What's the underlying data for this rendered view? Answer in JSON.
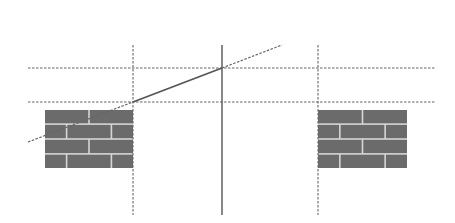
{
  "diagram": {
    "width": 455,
    "height": 223,
    "colors": {
      "background": "#ffffff",
      "brick": "#6b6b6b",
      "mortar": "#d6d6d6",
      "line": "#555555",
      "dashed": "#666666"
    },
    "guides": {
      "horizontal": [
        {
          "name": "upper-horizontal-guide",
          "y": 68,
          "x1": 28,
          "x2": 435
        },
        {
          "name": "lower-horizontal-guide",
          "y": 102,
          "x1": 28,
          "x2": 435
        }
      ],
      "vertical_dashed": [
        {
          "name": "left-vertical-guide",
          "x": 133,
          "y1": 45,
          "y2": 215
        },
        {
          "name": "right-vertical-guide",
          "x": 318,
          "y1": 45,
          "y2": 215
        }
      ],
      "vertical_solid": {
        "name": "center-vertical-line",
        "x": 222,
        "y1": 45,
        "y2": 215
      }
    },
    "sloped_line": {
      "solid": {
        "x1": 133,
        "y1": 102,
        "x2": 222,
        "y2": 68
      },
      "dashed_left": {
        "x1": 28,
        "y1": 142,
        "x2": 133,
        "y2": 102
      },
      "dashed_right": {
        "x1": 222,
        "y1": 68,
        "x2": 282,
        "y2": 45
      }
    },
    "walls": [
      {
        "name": "left-brick-wall",
        "x": 45,
        "y": 110,
        "w": 88,
        "h": 58
      },
      {
        "name": "right-brick-wall",
        "x": 318,
        "y": 110,
        "w": 89,
        "h": 58
      }
    ]
  }
}
